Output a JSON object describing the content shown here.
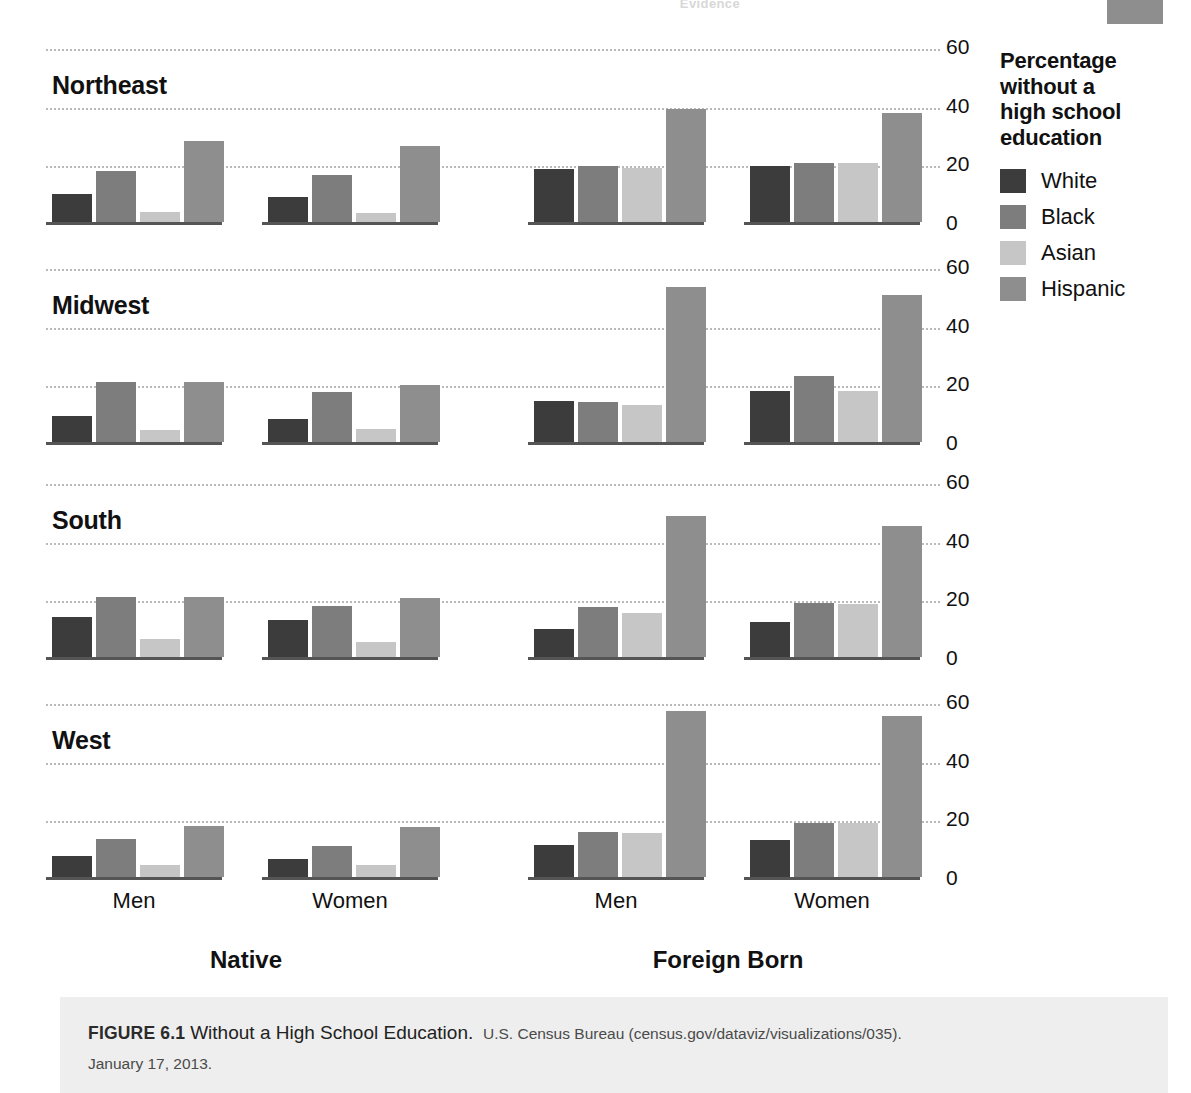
{
  "page": {
    "running_head": "Evidence"
  },
  "legend": {
    "title": "Percentage without a high school education",
    "title_lines": [
      "Percentage",
      "without a",
      "high school",
      "education"
    ],
    "items": [
      {
        "label": "White",
        "color": "#3c3c3c"
      },
      {
        "label": "Black",
        "color": "#7d7d7d"
      },
      {
        "label": "Asian",
        "color": "#c6c6c6"
      },
      {
        "label": "Hispanic",
        "color": "#8e8e8e"
      }
    ]
  },
  "axis": {
    "ticks": [
      "60",
      "40",
      "20",
      "0"
    ],
    "tick_values": [
      60,
      40,
      20,
      0
    ]
  },
  "sections": [
    {
      "label": "Native"
    },
    {
      "label": "Foreign Born"
    }
  ],
  "group_labels": [
    "Men",
    "Women",
    "Men",
    "Women"
  ],
  "caption": {
    "figure_number": "FIGURE 6.1",
    "title": "Without a High School Education.",
    "source": "U.S. Census Bureau (census.gov/dataviz/visualizations/035).",
    "date": "January 17, 2013."
  },
  "chart_data": {
    "type": "bar",
    "title": "Without a High School Education",
    "ylabel": "Percentage without a high school education",
    "xlabel": "",
    "ylim": [
      0,
      60
    ],
    "yticks": [
      0,
      20,
      40,
      60
    ],
    "grid": true,
    "legend_position": "right",
    "series_names": [
      "White",
      "Black",
      "Asian",
      "Hispanic"
    ],
    "series_colors": [
      "#3c3c3c",
      "#7d7d7d",
      "#c6c6c6",
      "#8e8e8e"
    ],
    "facet_rows": [
      "Northeast",
      "Midwest",
      "South",
      "West"
    ],
    "facet_cols": [
      "Native",
      "Foreign Born"
    ],
    "categories": [
      "Men",
      "Women"
    ],
    "panels": [
      {
        "region": "Northeast",
        "nativity": "Native",
        "groups": [
          {
            "category": "Men",
            "values": [
              9.5,
              17.5,
              3.5,
              27.5
            ]
          },
          {
            "category": "Women",
            "values": [
              8.5,
              16.0,
              3.0,
              26.0
            ]
          }
        ]
      },
      {
        "region": "Northeast",
        "nativity": "Foreign Born",
        "groups": [
          {
            "category": "Men",
            "values": [
              18.0,
              19.0,
              18.5,
              38.5
            ]
          },
          {
            "category": "Women",
            "values": [
              19.0,
              20.0,
              20.0,
              37.0
            ]
          }
        ]
      },
      {
        "region": "Midwest",
        "nativity": "Native",
        "groups": [
          {
            "category": "Men",
            "values": [
              9.0,
              20.5,
              4.0,
              20.5
            ]
          },
          {
            "category": "Women",
            "values": [
              8.0,
              17.0,
              4.5,
              19.5
            ]
          }
        ]
      },
      {
        "region": "Midwest",
        "nativity": "Foreign Born",
        "groups": [
          {
            "category": "Men",
            "values": [
              14.0,
              13.5,
              12.5,
              53.0
            ]
          },
          {
            "category": "Women",
            "values": [
              17.5,
              22.5,
              17.5,
              50.0
            ]
          }
        ]
      },
      {
        "region": "South",
        "nativity": "Native",
        "groups": [
          {
            "category": "Men",
            "values": [
              13.5,
              20.5,
              6.0,
              20.5
            ]
          },
          {
            "category": "Women",
            "values": [
              12.5,
              17.5,
              5.0,
              20.0
            ]
          }
        ]
      },
      {
        "region": "South",
        "nativity": "Foreign Born",
        "groups": [
          {
            "category": "Men",
            "values": [
              9.5,
              17.0,
              15.0,
              48.0
            ]
          },
          {
            "category": "Women",
            "values": [
              12.0,
              18.5,
              18.0,
              44.5
            ]
          }
        ]
      },
      {
        "region": "West",
        "nativity": "Native",
        "groups": [
          {
            "category": "Men",
            "values": [
              7.0,
              13.0,
              4.0,
              17.5
            ]
          },
          {
            "category": "Women",
            "values": [
              6.0,
              10.5,
              4.0,
              17.0
            ]
          }
        ]
      },
      {
        "region": "West",
        "nativity": "Foreign Born",
        "groups": [
          {
            "category": "Men",
            "values": [
              11.0,
              15.5,
              15.0,
              56.5
            ]
          },
          {
            "category": "Women",
            "values": [
              12.5,
              18.5,
              18.5,
              55.0
            ]
          }
        ]
      }
    ]
  }
}
